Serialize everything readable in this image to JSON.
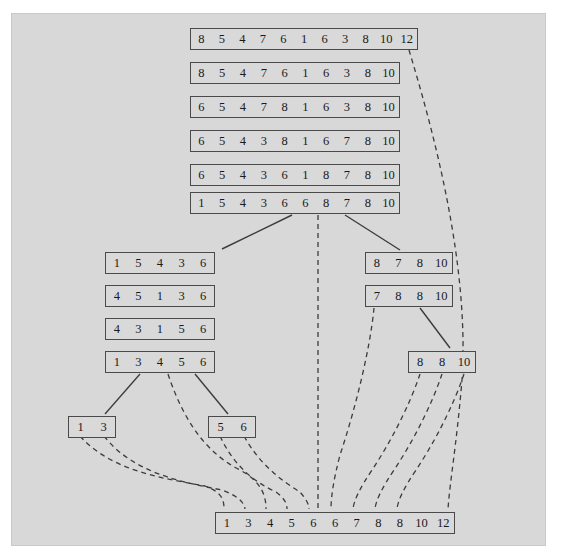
{
  "figure": {
    "title": "",
    "background_color": "#d8d8d8",
    "page_color": "#ffffff",
    "box_border_color": "#4a4a4a",
    "solid_link_color": "#3c3c3c",
    "dashed_link_color": "#3c3c3c"
  },
  "arrays": {
    "top_stack": [
      {
        "name": "row-1",
        "values": [
          "8",
          "5",
          "4",
          "7",
          "6",
          "1",
          "6",
          "3",
          "8",
          "10",
          "12"
        ],
        "x": 190,
        "y": 28,
        "width": 228,
        "cell_width": 20.7
      },
      {
        "name": "row-2",
        "values": [
          "8",
          "5",
          "4",
          "7",
          "6",
          "1",
          "6",
          "3",
          "8",
          "10"
        ],
        "x": 190,
        "y": 62,
        "width": 210,
        "cell_width": 21
      },
      {
        "name": "row-3",
        "values": [
          "6",
          "5",
          "4",
          "7",
          "8",
          "1",
          "6",
          "3",
          "8",
          "10"
        ],
        "x": 190,
        "y": 96,
        "width": 210,
        "cell_width": 21
      },
      {
        "name": "row-4",
        "values": [
          "6",
          "5",
          "4",
          "3",
          "8",
          "1",
          "6",
          "7",
          "8",
          "10"
        ],
        "x": 190,
        "y": 130,
        "width": 210,
        "cell_width": 21
      },
      {
        "name": "row-5",
        "values": [
          "6",
          "5",
          "4",
          "3",
          "6",
          "1",
          "8",
          "7",
          "8",
          "10"
        ],
        "x": 190,
        "y": 164,
        "width": 210,
        "cell_width": 21
      },
      {
        "name": "row-6",
        "values": [
          "1",
          "5",
          "4",
          "3",
          "6",
          "6",
          "8",
          "7",
          "8",
          "10"
        ],
        "x": 190,
        "y": 192,
        "width": 210,
        "cell_width": 21
      }
    ],
    "left_stack": [
      {
        "name": "left-row-1",
        "values": [
          "1",
          "5",
          "4",
          "3",
          "6"
        ],
        "x": 105,
        "y": 252,
        "width": 110,
        "cell_width": 22
      },
      {
        "name": "left-row-2",
        "values": [
          "4",
          "5",
          "1",
          "3",
          "6"
        ],
        "x": 105,
        "y": 285,
        "width": 110,
        "cell_width": 22
      },
      {
        "name": "left-row-3",
        "values": [
          "4",
          "3",
          "1",
          "5",
          "6"
        ],
        "x": 105,
        "y": 318,
        "width": 110,
        "cell_width": 22
      },
      {
        "name": "left-row-4",
        "values": [
          "1",
          "3",
          "4",
          "5",
          "6"
        ],
        "x": 105,
        "y": 351,
        "width": 110,
        "cell_width": 22
      }
    ],
    "right_stack": [
      {
        "name": "right-row-1",
        "values": [
          "8",
          "7",
          "8",
          "10"
        ],
        "x": 365,
        "y": 252,
        "width": 88,
        "cell_width": 22
      },
      {
        "name": "right-row-2",
        "values": [
          "7",
          "8",
          "8",
          "10"
        ],
        "x": 365,
        "y": 285,
        "width": 88,
        "cell_width": 22
      },
      {
        "name": "right-row-3",
        "values": [
          "8",
          "8",
          "10"
        ],
        "x": 408,
        "y": 351,
        "width": 68,
        "cell_width": 22.6
      }
    ],
    "leaves": [
      {
        "name": "leaf-left",
        "values": [
          "1",
          "3"
        ],
        "x": 68,
        "y": 416,
        "width": 48,
        "cell_width": 24
      },
      {
        "name": "leaf-right",
        "values": [
          "5",
          "6"
        ],
        "x": 208,
        "y": 416,
        "width": 48,
        "cell_width": 24
      }
    ],
    "result": {
      "name": "result-row",
      "values": [
        "1",
        "3",
        "4",
        "5",
        "6",
        "6",
        "7",
        "8",
        "8",
        "10",
        "12"
      ],
      "x": 215,
      "y": 512,
      "width": 240,
      "cell_width": 21.8
    }
  },
  "links": {
    "solid": [
      {
        "name": "row6-to-left-stack",
        "x1": 292,
        "y1": 215,
        "x2": 222,
        "y2": 249
      },
      {
        "name": "row6-to-right-stack",
        "x1": 345,
        "y1": 215,
        "x2": 400,
        "y2": 250
      },
      {
        "name": "left4-to-leaf-left",
        "x1": 140,
        "y1": 374,
        "x2": 105,
        "y2": 414
      },
      {
        "name": "left4-to-leaf-right",
        "x1": 195,
        "y1": 374,
        "x2": 228,
        "y2": 414
      },
      {
        "name": "right2-to-right3",
        "x1": 420,
        "y1": 308,
        "x2": 450,
        "y2": 348
      }
    ],
    "dashed": [
      {
        "name": "row1-12-to-result-12",
        "d": "M 409,50 C 430,120 470,260 462,380 C 456,450 450,480 448,509"
      },
      {
        "name": "row6-mid-to-result",
        "d": "M 318,215 L 318,300 L 318,420 L 318,509"
      },
      {
        "name": "left4-mid-to-result-4",
        "d": "M 168,374 C 180,410 200,450 240,470 C 262,482 266,496 266,509"
      },
      {
        "name": "leafL-1-to-result-1",
        "d": "M 80,436 C 110,470 160,478 205,486 C 222,492 224,500 224,509"
      },
      {
        "name": "leafL-3-to-result-3",
        "d": "M 104,436 C 132,472 180,482 222,490 C 238,496 244,502 245,509"
      },
      {
        "name": "leafR-5-to-result-5",
        "d": "M 220,436 C 232,462 250,480 276,492 C 284,498 287,503 287,509"
      },
      {
        "name": "leafR-6-to-result-6",
        "d": "M 244,436 C 258,462 280,480 300,492 C 306,499 309,504 309,509"
      },
      {
        "name": "right2-7-to-result-7",
        "d": "M 374,308 C 370,350 355,410 340,455 C 334,478 331,496 331,509"
      },
      {
        "name": "right3-8a-to-result-8a",
        "d": "M 420,374 C 410,404 392,440 372,470 C 360,488 354,500 353,509"
      },
      {
        "name": "right3-8b-to-result-8b",
        "d": "M 442,374 C 432,404 414,440 394,470 C 382,488 376,500 375,509"
      },
      {
        "name": "right3-10-to-result-10",
        "d": "M 464,374 C 454,404 436,440 416,470 C 404,488 398,500 397,509"
      }
    ]
  }
}
